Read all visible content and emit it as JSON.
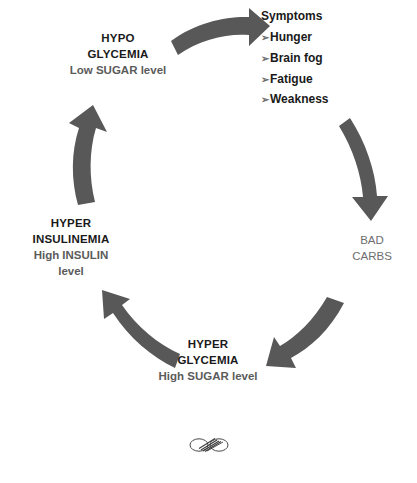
{
  "diagram": {
    "colors": {
      "arrow": "#585858",
      "heading_text": "#1a1a1a",
      "sub_text": "#5b5b5b",
      "muted_text": "#6e6e6e",
      "background": "#ffffff"
    },
    "nodes": {
      "hypoglycemia": {
        "line1": "HYPO",
        "line2": "GLYCEMIA",
        "sub": "Low SUGAR level"
      },
      "hyperinsulinemia": {
        "line1": "HYPER",
        "line2": "INSULINEMIA",
        "sub1": "High INSULIN",
        "sub2": "level"
      },
      "hyperglycemia": {
        "line1": "HYPER",
        "line2": "GLYCEMIA",
        "sub": "High SUGAR level"
      },
      "bad_carbs": {
        "line1": "BAD",
        "line2": "CARBS"
      }
    },
    "symptoms": {
      "heading": "Symptoms",
      "bullet_glyph": "➢",
      "items": [
        "Hunger",
        "Brain fog",
        "Fatigue",
        "Weakness"
      ]
    },
    "arrows": [
      {
        "name": "arrow-hypoglycemia-to-symptoms",
        "from": "HYPO GLYCEMIA",
        "to": "Symptoms",
        "direction": "right"
      },
      {
        "name": "arrow-symptoms-to-bad-carbs",
        "from": "Symptoms",
        "to": "BAD CARBS",
        "direction": "down"
      },
      {
        "name": "arrow-bad-carbs-to-hyperglycemia",
        "from": "BAD CARBS",
        "to": "HYPER GLYCEMIA",
        "direction": "down-left"
      },
      {
        "name": "arrow-hyperglycemia-to-hyperinsulinemia",
        "from": "HYPER GLYCEMIA",
        "to": "HYPER INSULINEMIA",
        "direction": "up-left"
      },
      {
        "name": "arrow-hyperinsulinemia-to-hypoglycemia",
        "from": "HYPER INSULINEMIA",
        "to": "HYPO GLYCEMIA",
        "direction": "up"
      }
    ],
    "ornament": "infinity-ornament"
  }
}
